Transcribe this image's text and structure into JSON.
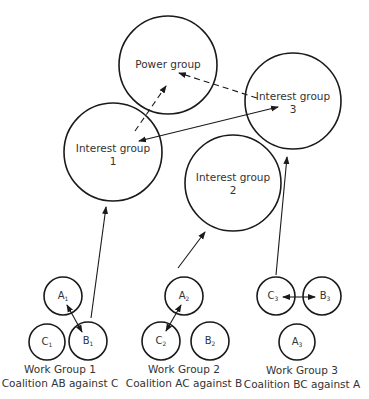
{
  "diagram": {
    "large_groups": [
      {
        "id": "power",
        "line1": "Power group",
        "line2": "",
        "cx": 168,
        "cy": 65,
        "r": 49
      },
      {
        "id": "ig1",
        "line1": "Interest group",
        "line2": "1",
        "cx": 113,
        "cy": 152,
        "r": 49
      },
      {
        "id": "ig2",
        "line1": "Interest group",
        "line2": "2",
        "cx": 233,
        "cy": 183,
        "r": 48
      },
      {
        "id": "ig3",
        "line1": "Interest group",
        "line2": "3",
        "cx": 293,
        "cy": 101,
        "r": 48
      }
    ],
    "work_groups": [
      {
        "caption1": "Work Group 1",
        "caption2": "Coalition AB against C",
        "members": [
          {
            "letter": "A",
            "sub": "1",
            "cx": 63,
            "cy": 296
          },
          {
            "letter": "C",
            "sub": "1",
            "cx": 47,
            "cy": 342
          },
          {
            "letter": "B",
            "sub": "1",
            "cx": 88,
            "cy": 341
          }
        ]
      },
      {
        "caption1": "Work Group 2",
        "caption2": "Coalition AC against B",
        "members": [
          {
            "letter": "A",
            "sub": "2",
            "cx": 184,
            "cy": 296
          },
          {
            "letter": "C",
            "sub": "2",
            "cx": 161,
            "cy": 341
          },
          {
            "letter": "B",
            "sub": "2",
            "cx": 210,
            "cy": 341
          }
        ]
      },
      {
        "caption1": "Work Group 3",
        "caption2": "Coalition BC against A",
        "members": [
          {
            "letter": "C",
            "sub": "3",
            "cx": 276,
            "cy": 296
          },
          {
            "letter": "B",
            "sub": "3",
            "cx": 322,
            "cy": 296
          },
          {
            "letter": "A",
            "sub": "3",
            "cx": 297,
            "cy": 342
          }
        ]
      }
    ],
    "relations": [
      {
        "from": "Interest group 1",
        "to": "Power group",
        "style": "dashed",
        "direction": "one-way"
      },
      {
        "from": "Interest group 3",
        "to": "Power group",
        "style": "dashed",
        "direction": "one-way"
      },
      {
        "from": "Interest group 1",
        "to": "Interest group 3",
        "style": "solid",
        "direction": "two-way"
      },
      {
        "from": "Work Group 1",
        "to": "Interest group 1",
        "style": "solid",
        "direction": "one-way"
      },
      {
        "from": "Work Group 2",
        "to": "Interest group 2",
        "style": "solid",
        "direction": "one-way"
      },
      {
        "from": "Work Group 3",
        "to": "Interest group 3",
        "style": "solid",
        "direction": "one-way"
      },
      {
        "from": "A1",
        "to": "B1",
        "style": "solid",
        "direction": "two-way"
      },
      {
        "from": "A2",
        "to": "C2",
        "style": "solid",
        "direction": "two-way"
      },
      {
        "from": "C3",
        "to": "B3",
        "style": "solid",
        "direction": "two-way"
      }
    ],
    "colors": {
      "stroke": "#1a1a1a",
      "text": "#333333",
      "background": "#ffffff"
    }
  }
}
